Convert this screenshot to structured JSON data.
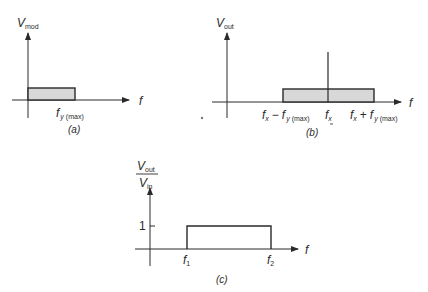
{
  "figure": {
    "panel_a": {
      "y_label_main": "V",
      "y_label_sub": "mod",
      "x_label": "f",
      "tick_label_main": "f",
      "tick_label_sub1": "y",
      "tick_label_sub2": "(max)",
      "caption": "(a)"
    },
    "panel_b": {
      "y_label_main": "V",
      "y_label_sub": "out",
      "x_label": "f",
      "tick_left_main1": "f",
      "tick_left_sub1": "x",
      "tick_left_op": "−",
      "tick_left_main2": "f",
      "tick_left_sub2": "y",
      "tick_left_sub3": "(max)",
      "tick_center_main": "f",
      "tick_center_sub": "x",
      "tick_right_main1": "f",
      "tick_right_sub1": "x",
      "tick_right_op": "+",
      "tick_right_main2": "f",
      "tick_right_sub2": "y",
      "tick_right_sub3": "(max)",
      "caption": "(b)"
    },
    "panel_c": {
      "y_num_main": "V",
      "y_num_sub": "out",
      "y_den_main": "V",
      "y_den_sub": "in",
      "y_tick": "1",
      "x_label": "f",
      "tick_f1_main": "f",
      "tick_f1_sub": "1",
      "tick_f2_main": "f",
      "tick_f2_sub": "2",
      "caption": "(c)"
    },
    "colors": {
      "line": "#2a2a2a",
      "fill": "#d8d8d8"
    }
  }
}
